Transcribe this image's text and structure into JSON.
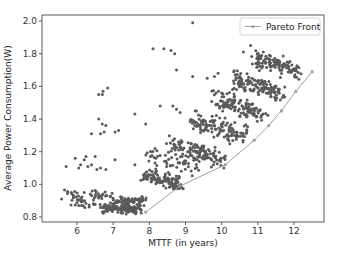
{
  "chart_data": {
    "type": "scatter",
    "title": "",
    "xlabel": "MTTF (in years)",
    "ylabel": "Average Power Consumption(W)",
    "xlim": [
      5.15,
      12.95
    ],
    "ylim": [
      0.77,
      2.05
    ],
    "xticks": [
      6,
      7,
      8,
      9,
      10,
      11,
      12
    ],
    "yticks": [
      0.8,
      1.0,
      1.2,
      1.4,
      1.6,
      1.8,
      2.0
    ],
    "xtick_labels": [
      "6",
      "7",
      "8",
      "9",
      "10",
      "11",
      "12"
    ],
    "ytick_labels": [
      "0.8",
      "1.0",
      "1.2",
      "1.4",
      "1.6",
      "1.8",
      "2.0"
    ],
    "grid": false,
    "legend": {
      "position": "upper right",
      "entries": [
        "Pareto Front"
      ]
    },
    "colors": {
      "scatter": "#5a5a5a",
      "pareto": "#a0a0a0",
      "axes": "#333333"
    },
    "clusters": [
      {
        "x_range": [
          5.4,
          7.2
        ],
        "y_center": 0.93,
        "n": 40,
        "spread_y": 0.03,
        "slope": 0.01
      },
      {
        "x_range": [
          5.5,
          7.5
        ],
        "y_center": 0.88,
        "n": 40,
        "spread_y": 0.025,
        "slope": -0.02
      },
      {
        "x_range": [
          6.6,
          7.9
        ],
        "y_center": 0.85,
        "n": 120,
        "spread_y": 0.02,
        "slope": 0.0
      },
      {
        "x_range": [
          6.9,
          8.0
        ],
        "y_center": 0.9,
        "n": 50,
        "spread_y": 0.02,
        "slope": 0.0
      },
      {
        "x_range": [
          7.7,
          9.0
        ],
        "y_center": 1.03,
        "n": 110,
        "spread_y": 0.04,
        "slope": -0.05
      },
      {
        "x_range": [
          7.8,
          9.5
        ],
        "y_center": 1.13,
        "n": 50,
        "spread_y": 0.05,
        "slope": -0.05
      },
      {
        "x_range": [
          8.4,
          10.2
        ],
        "y_center": 1.2,
        "n": 120,
        "spread_y": 0.05,
        "slope": -0.06
      },
      {
        "x_range": [
          9.0,
          10.9
        ],
        "y_center": 1.34,
        "n": 130,
        "spread_y": 0.05,
        "slope": -0.06
      },
      {
        "x_range": [
          9.6,
          11.3
        ],
        "y_center": 1.48,
        "n": 120,
        "spread_y": 0.05,
        "slope": -0.07
      },
      {
        "x_range": [
          10.2,
          11.8
        ],
        "y_center": 1.6,
        "n": 120,
        "spread_y": 0.05,
        "slope": -0.07
      },
      {
        "x_range": [
          10.8,
          12.3
        ],
        "y_center": 1.73,
        "n": 110,
        "spread_y": 0.045,
        "slope": -0.07
      }
    ],
    "outliers": [
      [
        5.7,
        1.11
      ],
      [
        5.95,
        1.16
      ],
      [
        6.05,
        1.1
      ],
      [
        6.1,
        1.12
      ],
      [
        6.2,
        1.15
      ],
      [
        6.25,
        1.17
      ],
      [
        6.3,
        1.11
      ],
      [
        6.4,
        1.12
      ],
      [
        6.5,
        1.17
      ],
      [
        6.55,
        1.09
      ],
      [
        6.65,
        1.1
      ],
      [
        6.8,
        1.09
      ],
      [
        6.4,
        1.31
      ],
      [
        6.6,
        1.4
      ],
      [
        6.65,
        1.31
      ],
      [
        6.7,
        1.37
      ],
      [
        6.8,
        1.36
      ],
      [
        6.75,
        1.32
      ],
      [
        6.6,
        1.55
      ],
      [
        6.7,
        1.55
      ],
      [
        6.72,
        1.57
      ],
      [
        6.85,
        1.59
      ],
      [
        7.05,
        1.32
      ],
      [
        7.15,
        1.33
      ],
      [
        7.05,
        1.15
      ],
      [
        7.6,
        1.43
      ],
      [
        7.9,
        1.37
      ],
      [
        7.6,
        1.12
      ],
      [
        8.1,
        1.83
      ],
      [
        8.4,
        1.83
      ],
      [
        8.6,
        1.82
      ],
      [
        8.7,
        1.8
      ],
      [
        8.75,
        1.7
      ],
      [
        9.2,
        1.99
      ],
      [
        9.2,
        1.66
      ],
      [
        9.6,
        1.65
      ],
      [
        9.8,
        1.66
      ],
      [
        9.9,
        1.68
      ],
      [
        8.3,
        1.48
      ],
      [
        8.65,
        1.48
      ],
      [
        8.75,
        1.46
      ],
      [
        8.85,
        1.44
      ],
      [
        9.3,
        1.45
      ],
      [
        10.0,
        1.56
      ],
      [
        10.3,
        1.58
      ],
      [
        10.6,
        1.81
      ],
      [
        10.8,
        1.85
      ],
      [
        11.2,
        1.93
      ],
      [
        11.0,
        1.75
      ]
    ],
    "series": [
      {
        "name": "Pareto Front",
        "type": "line",
        "points": [
          [
            7.9,
            0.83
          ],
          [
            8.85,
            0.99
          ],
          [
            10.1,
            1.12
          ],
          [
            10.9,
            1.27
          ],
          [
            11.3,
            1.36
          ],
          [
            11.65,
            1.45
          ],
          [
            12.05,
            1.57
          ],
          [
            12.5,
            1.69
          ]
        ]
      }
    ]
  }
}
